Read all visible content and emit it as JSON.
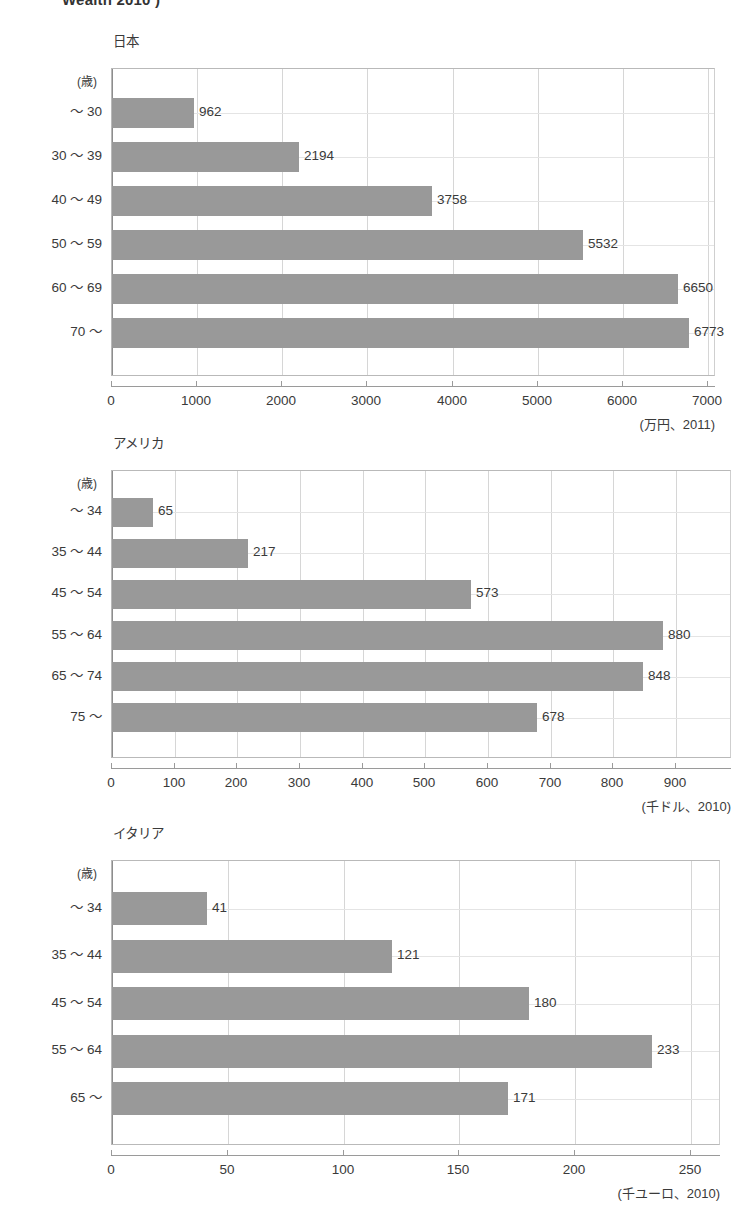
{
  "page": {
    "header_text": "Wealth 2010 )"
  },
  "axis_header_label": "(歳)",
  "chart_data": [
    {
      "type": "bar",
      "orientation": "horizontal",
      "title": "日本",
      "categories": [
        "～ 30",
        "30 ～ 39",
        "40 ～ 49",
        "50 ～ 59",
        "60 ～ 69",
        "70 ～"
      ],
      "values": [
        962,
        2194,
        3758,
        5532,
        6650,
        6773
      ],
      "value_labels": [
        "962",
        "2194",
        "3758",
        "5532",
        "6650",
        "6773"
      ],
      "ticks": [
        0,
        1000,
        2000,
        3000,
        4000,
        5000,
        6000,
        7000
      ],
      "tick_labels": [
        "0",
        "1000",
        "2000",
        "3000",
        "4000",
        "5000",
        "6000",
        "7000"
      ],
      "xlim": [
        0,
        7000
      ],
      "xlabel": "",
      "ylabel": "(歳)",
      "unit_note": "(万円、2011)",
      "grid": true,
      "legend": "none",
      "bar_color": "#999999"
    },
    {
      "type": "bar",
      "orientation": "horizontal",
      "title": "アメリカ",
      "categories": [
        "～ 34",
        "35 ～ 44",
        "45 ～ 54",
        "55 ～ 64",
        "65 ～ 74",
        "75 ～"
      ],
      "values": [
        65,
        217,
        573,
        880,
        848,
        678
      ],
      "value_labels": [
        "65",
        "217",
        "573",
        "880",
        "848",
        "678"
      ],
      "ticks": [
        0,
        100,
        200,
        300,
        400,
        500,
        600,
        700,
        800,
        900
      ],
      "tick_labels": [
        "0",
        "100",
        "200",
        "300",
        "400",
        "500",
        "600",
        "700",
        "800",
        "900"
      ],
      "xlim": [
        0,
        900
      ],
      "xlabel": "",
      "ylabel": "(歳)",
      "unit_note": "(千ドル、2010)",
      "grid": true,
      "legend": "none",
      "bar_color": "#999999"
    },
    {
      "type": "bar",
      "orientation": "horizontal",
      "title": "イタリア",
      "categories": [
        "～ 34",
        "35 ～ 44",
        "45 ～ 54",
        "55 ～ 64",
        "65 ～"
      ],
      "values": [
        41,
        121,
        180,
        233,
        171
      ],
      "value_labels": [
        "41",
        "121",
        "180",
        "233",
        "171"
      ],
      "ticks": [
        0,
        50,
        100,
        150,
        200,
        250
      ],
      "tick_labels": [
        "0",
        "50",
        "100",
        "150",
        "200",
        "250"
      ],
      "xlim": [
        0,
        250
      ],
      "xlabel": "",
      "ylabel": "(歳)",
      "unit_note": "(千ユーロ、2010)",
      "grid": true,
      "legend": "none",
      "bar_color": "#999999"
    }
  ],
  "colors": {
    "bar": "#999999",
    "grid": "#d6d6d6",
    "frame": "#b9b9b9",
    "text": "#3a3a3a"
  }
}
